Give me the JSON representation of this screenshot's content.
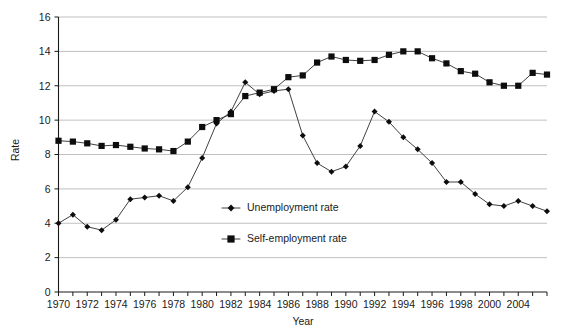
{
  "chart_data": {
    "type": "line",
    "title": "",
    "xlabel": "Year",
    "ylabel": "Rate",
    "xlim": [
      1970,
      2004
    ],
    "ylim": [
      0,
      16
    ],
    "y_ticks": [
      0,
      2,
      4,
      6,
      8,
      10,
      12,
      14,
      16
    ],
    "x_ticks": [
      1970,
      1971,
      1972,
      1973,
      1974,
      1975,
      1976,
      1977,
      1978,
      1979,
      1980,
      1981,
      1982,
      1983,
      1984,
      1985,
      1986,
      1987,
      1988,
      1989,
      1990,
      1991,
      1992,
      1993,
      1994,
      1995,
      1996,
      1997,
      1998,
      1999,
      2000,
      2001,
      2002,
      2003,
      2004
    ],
    "x_tick_labels": [
      "1970",
      "",
      "1972",
      "",
      "1974",
      "",
      "1976",
      "",
      "1978",
      "",
      "1980",
      "",
      "1982",
      "",
      "1984",
      "",
      "1986",
      "",
      "1988",
      "",
      "1990",
      "",
      "1992",
      "",
      "1994",
      "",
      "1996",
      "",
      "1998",
      "",
      "2000",
      "",
      "2004",
      "",
      ""
    ],
    "grid": true,
    "grid_axis": "y",
    "legend_position": "center-left-inside",
    "x": [
      1970,
      1971,
      1972,
      1973,
      1974,
      1975,
      1976,
      1977,
      1978,
      1979,
      1980,
      1981,
      1982,
      1983,
      1984,
      1985,
      1986,
      1987,
      1988,
      1989,
      1990,
      1991,
      1992,
      1993,
      1994,
      1995,
      1996,
      1997,
      1998,
      1999,
      2000,
      2001,
      2002,
      2003,
      2004
    ],
    "series": [
      {
        "name": "Unemployment rate",
        "marker": "diamond",
        "values": [
          4.0,
          4.5,
          3.8,
          3.6,
          4.2,
          5.4,
          5.5,
          5.6,
          5.3,
          6.1,
          7.8,
          9.8,
          10.5,
          12.2,
          11.5,
          11.7,
          11.8,
          9.1,
          7.5,
          7.0,
          7.3,
          8.5,
          10.5,
          9.9,
          9.0,
          8.3,
          7.5,
          6.4,
          6.4,
          5.7,
          5.1,
          5.0,
          5.3,
          5.0,
          4.7
        ]
      },
      {
        "name": "Self-employment rate",
        "marker": "square",
        "values": [
          8.8,
          8.75,
          8.65,
          8.5,
          8.55,
          8.45,
          8.35,
          8.3,
          8.2,
          8.75,
          9.6,
          10.0,
          10.35,
          11.4,
          11.6,
          11.8,
          12.5,
          12.6,
          13.35,
          13.7,
          13.5,
          13.45,
          13.5,
          13.8,
          14.0,
          14.0,
          13.6,
          13.3,
          12.85,
          12.7,
          12.2,
          12.0,
          12.0,
          12.75,
          12.65
        ]
      }
    ]
  },
  "legend": {
    "entries": [
      {
        "label": "Unemployment rate",
        "marker": "diamond"
      },
      {
        "label": "Self-employment rate",
        "marker": "square"
      }
    ]
  },
  "colors": {
    "series_line": "#2b2b2b",
    "marker": "#0d0d0d",
    "gridline": "#b9b9b9",
    "axis": "#1a1a1a",
    "background": "#ffffff"
  }
}
